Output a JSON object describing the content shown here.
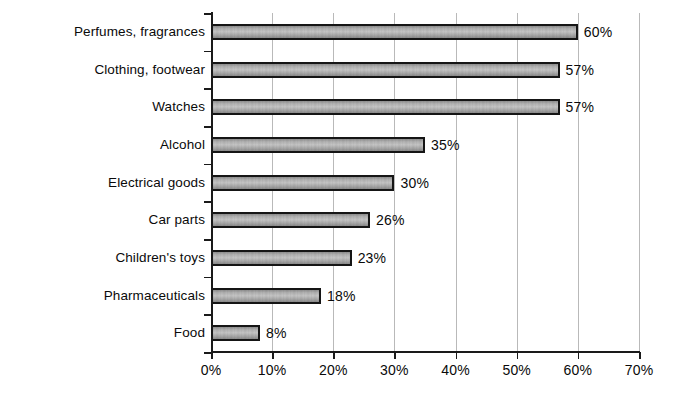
{
  "chart_data": {
    "type": "bar",
    "orientation": "horizontal",
    "title": "",
    "xlabel": "",
    "ylabel": "",
    "categories": [
      "Perfumes, fragrances",
      "Clothing, footwear",
      "Watches",
      "Alcohol",
      "Electrical goods",
      "Car parts",
      "Children's toys",
      "Pharmaceuticals",
      "Food"
    ],
    "values": [
      60,
      57,
      57,
      35,
      30,
      26,
      23,
      18,
      8
    ],
    "value_labels": [
      "60%",
      "57%",
      "57%",
      "35%",
      "30%",
      "26%",
      "23%",
      "18%",
      "8%"
    ],
    "xlim": [
      0,
      70
    ],
    "xticks": [
      0,
      10,
      20,
      30,
      40,
      50,
      60,
      70
    ],
    "xtick_labels": [
      "0%",
      "10%",
      "20%",
      "30%",
      "40%",
      "50%",
      "60%",
      "70%"
    ],
    "grid": true,
    "grid_axis": "x",
    "legend": null,
    "colors": {
      "bar_fill": "#bdbdbd",
      "bar_edge": "#151515",
      "gridline": "#b9b9b9",
      "axis": "#1a1a1a",
      "text": "#0a0a0a",
      "background": "#ffffff"
    }
  }
}
